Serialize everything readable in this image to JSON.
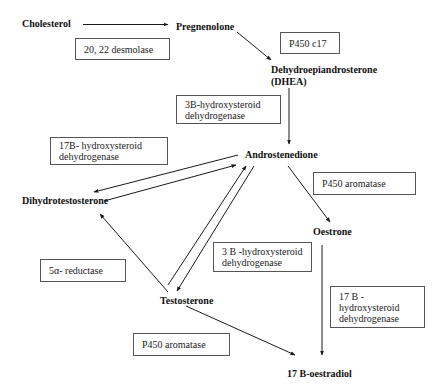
{
  "diagram": {
    "nodes": {
      "cholesterol": "Cholesterol",
      "pregnenolone": "Pregnenolone",
      "dhea_line1": "Dehydroepiandrosterone",
      "dhea_line2": "(DHEA)",
      "androstenedione": "Androstenedione",
      "dihydrotestosterone": "Dihydrotestosterone",
      "oestrone": "Oestrone",
      "testosterone": "Testosterone",
      "oestradiol": "17 B-oestradiol"
    },
    "enzymes": {
      "desmolase": [
        "20, 22 desmolase"
      ],
      "p450_c17": [
        "P450 c17"
      ],
      "hsd3b_upper": [
        "3B-hydroxysteroid",
        "dehydrogenase"
      ],
      "hsd17b_left": [
        "17B- hydroxysteroid",
        "dehydrogenase"
      ],
      "p450_aromatase_right": [
        "P450 aromatase"
      ],
      "reductase_5a": [
        "5α- reductase"
      ],
      "hsd3b_lower": [
        "3 B -hydroxysteroid",
        "dehydrogenase"
      ],
      "hsd17b_right": [
        "17 B -",
        "hydroxysteroid",
        "dehydrogenase"
      ],
      "p450_aromatase_lower": [
        "P450 aromatase"
      ]
    },
    "edges": [
      {
        "from": "Cholesterol",
        "to": "Pregnenolone",
        "enzyme": "20, 22 desmolase"
      },
      {
        "from": "Pregnenolone",
        "to": "Dehydroepiandrosterone (DHEA)",
        "enzyme": "P450 c17"
      },
      {
        "from": "Dehydroepiandrosterone (DHEA)",
        "to": "Androstenedione",
        "enzyme": "3B-hydroxysteroid dehydrogenase"
      },
      {
        "from": "Androstenedione",
        "to": "Dihydrotestosterone",
        "enzyme": "17B- hydroxysteroid dehydrogenase"
      },
      {
        "from": "Dihydrotestosterone",
        "to": "Androstenedione",
        "enzyme": "17B- hydroxysteroid dehydrogenase"
      },
      {
        "from": "Androstenedione",
        "to": "Oestrone",
        "enzyme": "P450 aromatase"
      },
      {
        "from": "Testosterone",
        "to": "Dihydrotestosterone",
        "enzyme": "5α- reductase"
      },
      {
        "from": "Testosterone",
        "to": "Androstenedione",
        "enzyme": "3 B -hydroxysteroid dehydrogenase"
      },
      {
        "from": "Androstenedione",
        "to": "Testosterone",
        "enzyme": "3 B -hydroxysteroid dehydrogenase"
      },
      {
        "from": "Oestrone",
        "to": "17 B-oestradiol",
        "enzyme": "17 B - hydroxysteroid dehydrogenase"
      },
      {
        "from": "Testosterone",
        "to": "17 B-oestradiol",
        "enzyme": "P450 aromatase"
      }
    ],
    "colors": {
      "line": "#1a1a1a",
      "box_border": "#555555",
      "background": "#ffffff"
    }
  }
}
